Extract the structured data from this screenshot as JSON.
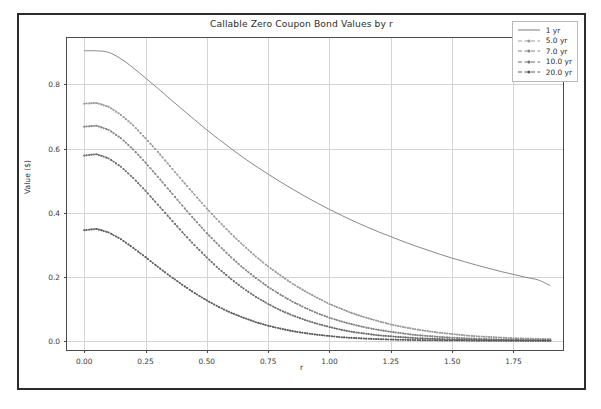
{
  "chart_data": {
    "type": "line",
    "title": "Callable Zero Coupon Bond Values by r",
    "xlabel": "r",
    "ylabel": "Value ($)",
    "xlim": [
      -0.07,
      1.96
    ],
    "ylim": [
      -0.035,
      0.945
    ],
    "grid": true,
    "legend_position": "upper right",
    "xticks": [
      "0.00",
      "0.25",
      "0.50",
      "0.75",
      "1.00",
      "1.25",
      "1.50",
      "1.75"
    ],
    "xtick_values": [
      0.0,
      0.25,
      0.5,
      0.75,
      1.0,
      1.25,
      1.5,
      1.75
    ],
    "yticks": [
      "0.0",
      "0.2",
      "0.4",
      "0.6",
      "0.8"
    ],
    "ytick_values": [
      0.0,
      0.2,
      0.4,
      0.6,
      0.8
    ],
    "x": [
      0.0,
      0.05,
      0.1,
      0.15,
      0.2,
      0.25,
      0.3,
      0.35,
      0.4,
      0.45,
      0.5,
      0.55,
      0.6,
      0.65,
      0.7,
      0.75,
      0.8,
      0.85,
      0.9,
      0.95,
      1.0,
      1.05,
      1.1,
      1.15,
      1.2,
      1.25,
      1.3,
      1.35,
      1.4,
      1.45,
      1.5,
      1.55,
      1.6,
      1.65,
      1.7,
      1.75,
      1.8,
      1.85,
      1.9
    ],
    "series": [
      {
        "name": "1 yr",
        "style": "solid",
        "color": "#7a7a7a",
        "values": [
          0.905,
          0.905,
          0.9,
          0.88,
          0.852,
          0.82,
          0.788,
          0.755,
          0.722,
          0.69,
          0.658,
          0.628,
          0.599,
          0.571,
          0.545,
          0.52,
          0.496,
          0.473,
          0.451,
          0.43,
          0.41,
          0.391,
          0.373,
          0.356,
          0.34,
          0.325,
          0.31,
          0.296,
          0.283,
          0.27,
          0.258,
          0.247,
          0.236,
          0.226,
          0.216,
          0.207,
          0.198,
          0.19,
          0.172
        ]
      },
      {
        "name": "5.0 yr",
        "style": "dashdot",
        "color": "#9a9a9a",
        "values": [
          0.74,
          0.742,
          0.73,
          0.705,
          0.672,
          0.632,
          0.59,
          0.545,
          0.5,
          0.456,
          0.413,
          0.372,
          0.333,
          0.297,
          0.263,
          0.232,
          0.204,
          0.178,
          0.155,
          0.134,
          0.115,
          0.099,
          0.084,
          0.072,
          0.061,
          0.051,
          0.043,
          0.036,
          0.03,
          0.025,
          0.021,
          0.017,
          0.014,
          0.012,
          0.01,
          0.008,
          0.007,
          0.006,
          0.005
        ]
      },
      {
        "name": "7.0 yr",
        "style": "dashdot",
        "color": "#858585",
        "values": [
          0.668,
          0.671,
          0.658,
          0.632,
          0.597,
          0.556,
          0.512,
          0.467,
          0.422,
          0.378,
          0.336,
          0.297,
          0.26,
          0.226,
          0.196,
          0.168,
          0.144,
          0.122,
          0.103,
          0.086,
          0.072,
          0.06,
          0.05,
          0.041,
          0.034,
          0.028,
          0.023,
          0.018,
          0.015,
          0.012,
          0.0097,
          0.0078,
          0.0063,
          0.005,
          0.004,
          0.0032,
          0.0026,
          0.0021,
          0.0017
        ]
      },
      {
        "name": "10.0 yr",
        "style": "dashdot",
        "color": "#6e6e6e",
        "values": [
          0.578,
          0.582,
          0.569,
          0.543,
          0.508,
          0.468,
          0.425,
          0.382,
          0.339,
          0.298,
          0.26,
          0.224,
          0.192,
          0.163,
          0.137,
          0.115,
          0.095,
          0.079,
          0.065,
          0.053,
          0.043,
          0.034,
          0.027,
          0.022,
          0.017,
          0.014,
          0.011,
          0.0085,
          0.0067,
          0.0053,
          0.0041,
          0.0032,
          0.0025,
          0.002,
          0.0015,
          0.0012,
          0.0009,
          0.0007,
          0.0006
        ]
      },
      {
        "name": "20.0 yr",
        "style": "dashdot",
        "color": "#5c5c5c",
        "values": [
          0.345,
          0.349,
          0.338,
          0.317,
          0.29,
          0.261,
          0.231,
          0.202,
          0.175,
          0.149,
          0.126,
          0.105,
          0.087,
          0.072,
          0.058,
          0.047,
          0.038,
          0.03,
          0.024,
          0.019,
          0.015,
          0.011,
          0.0087,
          0.0067,
          0.0051,
          0.0039,
          0.003,
          0.0023,
          0.0017,
          0.0013,
          0.001,
          0.0007,
          0.0005,
          0.0004,
          0.0003,
          0.0002,
          0.0002,
          0.0001,
          0.0001
        ]
      }
    ]
  }
}
